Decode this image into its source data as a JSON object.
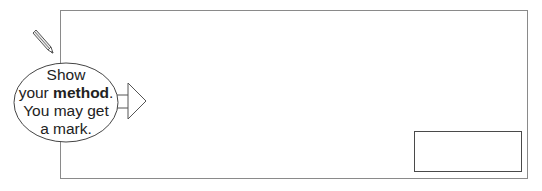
{
  "hint_bubble": {
    "line1": "Show",
    "line2_prefix": "your ",
    "line2_bold": "method",
    "line2_suffix": ".",
    "line3": "You may get",
    "line4": "a mark."
  },
  "icons": {
    "pencil": "pencil-icon",
    "arrow": "arrow-right-icon"
  },
  "answer_box": {
    "value": ""
  },
  "colors": {
    "box_border": "#8a8a8a",
    "answer_border": "#4a4a4a",
    "text": "#222222"
  }
}
